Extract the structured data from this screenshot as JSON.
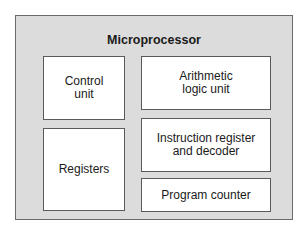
{
  "diagram": {
    "title": "Microprocessor",
    "components": [
      {
        "id": "control-unit",
        "label": "Control\nunit"
      },
      {
        "id": "alu",
        "label": "Arithmetic\nlogic unit"
      },
      {
        "id": "registers",
        "label": "Registers"
      },
      {
        "id": "instruction-register",
        "label": "Instruction register\nand decoder"
      },
      {
        "id": "program-counter",
        "label": "Program counter"
      }
    ]
  }
}
